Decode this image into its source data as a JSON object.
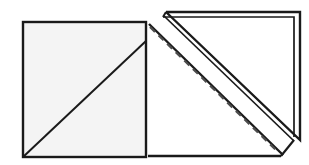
{
  "figure": {
    "title": "Square with shaded half-triangle reflected across a diagonal fold line",
    "type": "geometry-diagram",
    "canvas": {
      "width": 309,
      "height": 165,
      "background": "#ffffff"
    },
    "colors": {
      "stroke": "#1a1a1a",
      "square_fill_light": "#f4f4f4",
      "shaded_triangle_fill": "#d0d0d0",
      "flipped_triangle_fill": "#ffffff",
      "dashed_line": "#4d4d4d"
    },
    "stroke_widths": {
      "square_outline": 2.4,
      "diagonal": 2.0,
      "flipped_outer": 2.4,
      "flipped_inner": 1.6,
      "dashed": 2.2
    },
    "dash_pattern": "7 5",
    "shapes": [
      {
        "name": "square-outline",
        "label": "Square",
        "points": "23,22 146,22 146,157 23,157",
        "fill": "#f4f4f4"
      },
      {
        "name": "shaded-triangle",
        "label": "Shaded triangle (lower-right half of square)",
        "points": "146,41 146,157 23,157",
        "fill": "#d0d0d0"
      },
      {
        "name": "unshaded-triangle",
        "label": "Unshaded triangle (upper-left half of square)",
        "points": "23,22 146,22 146,41 23,157",
        "fill": "#f4f4f4"
      },
      {
        "name": "diagonal-line",
        "label": "Diagonal of the square",
        "from": "23,157",
        "to": "146,41"
      },
      {
        "name": "flipped-triangle-outer",
        "label": "Flipped triangle outer outline",
        "points": "166,12 300,12 300,140"
      },
      {
        "name": "flipped-triangle-inner",
        "label": "Flipped triangle inner outline",
        "points": "163,17 294,17 294,137"
      },
      {
        "name": "flipped-triangle-body",
        "label": "Flipped triangle lower body",
        "points": "148,25 279,156 148,156"
      },
      {
        "name": "fold-line-dashed",
        "label": "Dashed fold / reflection line",
        "from": "150,27",
        "to": "278,152"
      }
    ],
    "annotations": []
  }
}
